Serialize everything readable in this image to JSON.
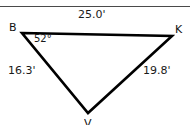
{
  "figure": {
    "type": "triangle-diagram",
    "background_color": "#ffffff",
    "stroke_color": "#000000",
    "rule_color": "#4a4a4a"
  },
  "vertices": {
    "top_left": {
      "label": "B",
      "x": 22,
      "y": 33
    },
    "top_right": {
      "label": "K",
      "x": 172,
      "y": 36
    },
    "bottom": {
      "label": "V",
      "x": 88,
      "y": 113,
      "clipped": true
    }
  },
  "sides": {
    "top": {
      "label": "25.0'",
      "from": "B",
      "to": "K"
    },
    "left": {
      "label": "16.3'",
      "from": "B",
      "to": "V"
    },
    "right": {
      "label": "19.8'",
      "from": "K",
      "to": "V"
    }
  },
  "angles": {
    "at_b": {
      "label": "52°",
      "vertex": "B"
    }
  }
}
